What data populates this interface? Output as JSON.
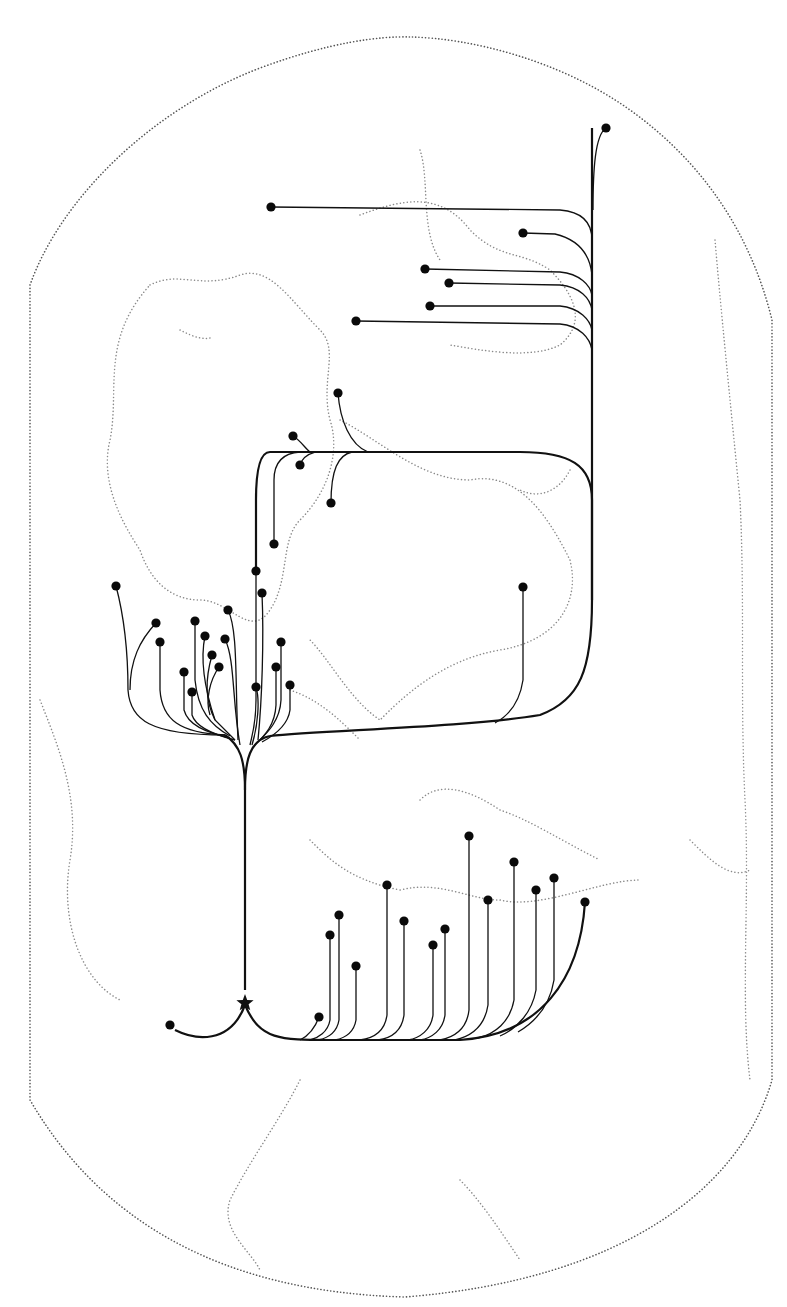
{
  "map": {
    "title": "",
    "colors": {
      "ink": "#111111",
      "coast": "#8a8a8a",
      "frame": "#555555",
      "background": "#ffffff"
    },
    "origin": {
      "icon": "star-icon",
      "x": 245,
      "y": 1003
    },
    "frame_path": "M30,285 C60,200 150,110 260,68 C330,42 380,36 410,37 C470,38 560,60 630,110 C700,160 750,230 772,320 L772,1080 C740,1190 620,1280 405,1297 C220,1292 100,1220 30,1100 Z",
    "coast_paths": [
      "M150,285 C180,270 200,290 240,275 C270,265 290,300 320,330 C340,350 320,380 330,420 C340,450 330,490 300,520 C280,540 290,580 270,610 C250,640 230,600 200,600 C170,600 150,580 140,550 C120,520 100,480 110,440 C120,390 100,340 150,285",
      "M360,215 C400,200 440,190 470,230 C500,260 520,250 550,270 C570,290 590,320 560,345 C530,360 480,350 450,345",
      "M420,150 C430,180 420,230 440,260",
      "M340,420 C380,440 420,480 470,480 C520,470 550,520 570,560 C580,600 560,640 500,650 C440,660 400,700 380,720 C350,700 330,660 310,640",
      "M290,690 C320,700 340,720 360,740",
      "M570,470 C560,490 540,500 520,490",
      "M310,840 C330,860 350,880 400,890 C440,880 470,900 500,900 C540,910 600,880 640,880",
      "M420,800 C440,780 470,790 500,810 C530,820 560,840 600,860",
      "M300,1080 C280,1120 250,1160 230,1200 C220,1230 250,1250 260,1270",
      "M460,1180 C480,1200 500,1230 520,1260",
      "M715,240 C720,300 730,400 740,500 C745,600 740,700 745,800 C750,900 740,1000 750,1080",
      "M40,700 C60,750 80,800 70,860 C60,920 80,980 120,1000",
      "M690,840 C710,860 730,880 750,870",
      "M180,330 C190,335 200,340 210,338"
    ],
    "nodes": [
      {
        "id": "n1",
        "x": 606,
        "y": 128
      },
      {
        "id": "n2",
        "x": 271,
        "y": 207
      },
      {
        "id": "n3",
        "x": 523,
        "y": 233
      },
      {
        "id": "n4",
        "x": 425,
        "y": 269
      },
      {
        "id": "n5",
        "x": 449,
        "y": 283
      },
      {
        "id": "n6",
        "x": 430,
        "y": 306
      },
      {
        "id": "n7",
        "x": 356,
        "y": 321
      },
      {
        "id": "n8",
        "x": 338,
        "y": 393
      },
      {
        "id": "n9",
        "x": 293,
        "y": 436
      },
      {
        "id": "n10",
        "x": 300,
        "y": 465
      },
      {
        "id": "n11",
        "x": 331,
        "y": 503
      },
      {
        "id": "n12",
        "x": 274,
        "y": 544
      },
      {
        "id": "n13",
        "x": 256,
        "y": 571
      },
      {
        "id": "n14",
        "x": 262,
        "y": 593
      },
      {
        "id": "n15",
        "x": 523,
        "y": 587
      },
      {
        "id": "n16",
        "x": 116,
        "y": 586
      },
      {
        "id": "n17",
        "x": 156,
        "y": 623
      },
      {
        "id": "n18",
        "x": 160,
        "y": 642
      },
      {
        "id": "n19",
        "x": 195,
        "y": 621
      },
      {
        "id": "n20",
        "x": 205,
        "y": 636
      },
      {
        "id": "n21",
        "x": 212,
        "y": 655
      },
      {
        "id": "n22",
        "x": 219,
        "y": 667
      },
      {
        "id": "n23",
        "x": 184,
        "y": 672
      },
      {
        "id": "n24",
        "x": 192,
        "y": 692
      },
      {
        "id": "n25",
        "x": 228,
        "y": 610
      },
      {
        "id": "n26",
        "x": 225,
        "y": 639
      },
      {
        "id": "n27",
        "x": 281,
        "y": 642
      },
      {
        "id": "n28",
        "x": 276,
        "y": 667
      },
      {
        "id": "n29",
        "x": 256,
        "y": 687
      },
      {
        "id": "n30",
        "x": 290,
        "y": 685
      },
      {
        "id": "n31",
        "x": 170,
        "y": 1025
      },
      {
        "id": "n32",
        "x": 319,
        "y": 1017
      },
      {
        "id": "n33",
        "x": 330,
        "y": 935
      },
      {
        "id": "n34",
        "x": 339,
        "y": 915
      },
      {
        "id": "n35",
        "x": 356,
        "y": 966
      },
      {
        "id": "n36",
        "x": 387,
        "y": 885
      },
      {
        "id": "n37",
        "x": 404,
        "y": 921
      },
      {
        "id": "n38",
        "x": 433,
        "y": 945
      },
      {
        "id": "n39",
        "x": 445,
        "y": 929
      },
      {
        "id": "n40",
        "x": 469,
        "y": 836
      },
      {
        "id": "n41",
        "x": 488,
        "y": 900
      },
      {
        "id": "n42",
        "x": 514,
        "y": 862
      },
      {
        "id": "n43",
        "x": 536,
        "y": 890
      },
      {
        "id": "n44",
        "x": 554,
        "y": 878
      },
      {
        "id": "n45",
        "x": 585,
        "y": 902
      }
    ],
    "trunks": [
      "M245,990 L245,790 C245,760 250,740 270,736",
      "M245,790 C245,760 240,745 225,735",
      "M270,736 C320,730 460,728 540,715 C580,700 592,670 592,600 L592,500 C592,465 570,452 520,452 L270,452 C260,452 256,470 256,500 L256,571",
      "M175,1030 C195,1040 230,1045 245,1005 C260,1040 280,1040 330,1040 L460,1040 C540,1035 580,980 585,902",
      "M592,600 L592,128"
    ],
    "routes": [
      "M606,128 C595,135 593,170 593,210",
      "M271,207 L560,210 C585,212 592,225 592,240",
      "M523,233 L555,234 C580,240 590,255 592,275",
      "M425,269 L560,272 C580,274 590,285 592,295",
      "M449,283 L560,285 C580,287 590,298 592,310",
      "M430,306 L560,306 C580,308 590,320 592,330",
      "M356,321 L560,324 C580,326 590,338 592,350",
      "M338,393 C340,420 350,445 368,452",
      "M293,436 C300,440 305,448 310,452",
      "M300,465 C302,458 308,454 315,452",
      "M331,503 C331,470 338,455 352,452",
      "M274,544 L274,480 C274,460 285,453 300,452",
      "M523,587 L523,680 C520,700 510,715 495,723",
      "M116,586 C125,620 128,660 128,690 C130,720 150,735 225,735",
      "M156,623 C140,640 130,660 130,690",
      "M160,642 L160,690 C162,720 180,733 225,735",
      "M195,621 L195,680 C198,710 210,725 230,736",
      "M205,636 C200,660 205,690 215,720 L235,740",
      "M212,655 C205,680 205,700 215,720",
      "M219,667 C210,680 205,700 210,715",
      "M184,672 L184,710 C188,725 205,732 230,738",
      "M192,692 L192,715 C196,728 215,735 235,740",
      "M228,610 C238,630 235,680 238,740",
      "M225,639 C235,660 232,700 240,745",
      "M281,642 L281,700 C280,720 268,732 260,740",
      "M276,667 L276,705 C275,725 265,735 255,745",
      "M256,687 C260,700 258,725 252,745",
      "M290,685 L290,710 C288,725 275,735 262,742",
      "M262,593 C264,640 262,700 258,740",
      "M256,571 L256,700 C256,725 252,735 250,745",
      "M319,1017 C315,1028 308,1036 300,1040",
      "M330,935 L330,1020 C328,1032 318,1038 310,1040",
      "M339,915 L339,1020 C337,1032 328,1038 318,1040",
      "M356,966 L356,1020 C354,1032 345,1038 335,1040",
      "M387,885 L387,1015 C385,1030 375,1038 360,1040",
      "M404,921 L404,1015 C402,1030 392,1038 378,1040",
      "M433,945 L433,1015 C431,1030 420,1038 408,1040",
      "M445,929 L445,1015 C443,1030 432,1038 420,1040",
      "M469,836 L469,1010 C467,1028 455,1037 440,1040",
      "M488,900 L488,1005 C485,1025 472,1036 455,1040",
      "M514,862 L514,1000 C510,1022 495,1034 478,1038",
      "M536,890 L536,990 C532,1012 518,1028 500,1036",
      "M554,878 L554,980 C550,1005 535,1022 518,1032"
    ]
  }
}
